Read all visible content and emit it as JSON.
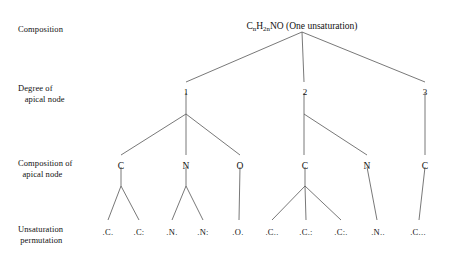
{
  "figure": {
    "type": "tree-diagram",
    "background": "#ffffff",
    "line_color": "#555555",
    "text_color": "#111111"
  },
  "row_labels": [
    {
      "id": "composition",
      "text": "Composition",
      "x": 18,
      "y": 24,
      "align": "left"
    },
    {
      "id": "degree-of-apical-node",
      "text": "Degree of\n   apical node",
      "x": 18,
      "y": 83,
      "align": "left"
    },
    {
      "id": "composition-of-apical-node",
      "text": "Composition of\n  apical node",
      "x": 18,
      "y": 158,
      "align": "left"
    },
    {
      "id": "unsaturation-permutation",
      "text": "Unsaturation\n permutation",
      "x": 18,
      "y": 224,
      "align": "left"
    }
  ],
  "root": {
    "id": "root",
    "label_prefix": "C",
    "sub1": "n",
    "label_mid": "H",
    "sub2": "2n",
    "label_suffix": "NO (One unsaturation)",
    "plain_text": "CnH2nNO (One unsaturation)",
    "x": 302,
    "y": 22
  },
  "degree_nodes": [
    {
      "id": "degree-1",
      "label": "1",
      "x": 186,
      "y": 88
    },
    {
      "id": "degree-2",
      "label": "2",
      "x": 305,
      "y": 88
    },
    {
      "id": "degree-3",
      "label": "3",
      "x": 425,
      "y": 88
    }
  ],
  "composition_nodes": [
    {
      "id": "comp-1-c",
      "label": "C",
      "x": 121,
      "y": 162,
      "parent": "degree-1"
    },
    {
      "id": "comp-1-n",
      "label": "N",
      "x": 186,
      "y": 162,
      "parent": "degree-1"
    },
    {
      "id": "comp-1-o",
      "label": "O",
      "x": 240,
      "y": 162,
      "parent": "degree-1"
    },
    {
      "id": "comp-2-c",
      "label": "C",
      "x": 305,
      "y": 162,
      "parent": "degree-2"
    },
    {
      "id": "comp-2-n",
      "label": "N",
      "x": 367,
      "y": 162,
      "parent": "degree-2"
    },
    {
      "id": "comp-3-c",
      "label": "C",
      "x": 425,
      "y": 162,
      "parent": "degree-3"
    }
  ],
  "permutation_nodes": [
    {
      "id": "perm-1",
      "label": ".C.",
      "x": 108,
      "y": 228,
      "parent": "comp-1-c"
    },
    {
      "id": "perm-2",
      "label": ".C:",
      "x": 139,
      "y": 228,
      "parent": "comp-1-c"
    },
    {
      "id": "perm-3",
      "label": ".N.",
      "x": 172,
      "y": 228,
      "parent": "comp-1-n"
    },
    {
      "id": "perm-4",
      "label": ".N:",
      "x": 203,
      "y": 228,
      "parent": "comp-1-n"
    },
    {
      "id": "perm-5",
      "label": ".O.",
      "x": 238,
      "y": 228,
      "parent": "comp-1-o"
    },
    {
      "id": "perm-6",
      "label": ".C..",
      "x": 272,
      "y": 228,
      "parent": "comp-2-c"
    },
    {
      "id": "perm-7",
      "label": ".C.:",
      "x": 306,
      "y": 228,
      "parent": "comp-2-c"
    },
    {
      "id": "perm-8",
      "label": ".C:.",
      "x": 341,
      "y": 228,
      "parent": "comp-2-c"
    },
    {
      "id": "perm-9",
      "label": ".N..",
      "x": 378,
      "y": 228,
      "parent": "comp-2-n"
    },
    {
      "id": "perm-10",
      "label": ".C...",
      "x": 418,
      "y": 228,
      "parent": "comp-3-c"
    }
  ],
  "edges": [
    {
      "id": "edge-root-1",
      "x1": 302,
      "y1": 32,
      "x2": 186,
      "y2": 82
    },
    {
      "id": "edge-root-2",
      "x1": 302,
      "y1": 32,
      "x2": 304,
      "y2": 82
    },
    {
      "id": "edge-root-3",
      "x1": 302,
      "y1": 32,
      "x2": 425,
      "y2": 82
    },
    {
      "id": "edge-1-stem",
      "x1": 186,
      "y1": 93,
      "x2": 186,
      "y2": 114
    },
    {
      "id": "edge-1-c",
      "x1": 186,
      "y1": 114,
      "x2": 121,
      "y2": 155
    },
    {
      "id": "edge-1-n",
      "x1": 186,
      "y1": 114,
      "x2": 186,
      "y2": 155
    },
    {
      "id": "edge-1-o",
      "x1": 186,
      "y1": 114,
      "x2": 240,
      "y2": 155
    },
    {
      "id": "edge-2-stem",
      "x1": 304,
      "y1": 93,
      "x2": 304,
      "y2": 114
    },
    {
      "id": "edge-2-c",
      "x1": 304,
      "y1": 114,
      "x2": 304,
      "y2": 155
    },
    {
      "id": "edge-2-n",
      "x1": 304,
      "y1": 114,
      "x2": 367,
      "y2": 155
    },
    {
      "id": "edge-3-c",
      "x1": 425,
      "y1": 93,
      "x2": 425,
      "y2": 155
    },
    {
      "id": "edge-c1-stem",
      "x1": 121,
      "y1": 167,
      "x2": 121,
      "y2": 186
    },
    {
      "id": "edge-c1-a",
      "x1": 121,
      "y1": 186,
      "x2": 108,
      "y2": 220
    },
    {
      "id": "edge-c1-b",
      "x1": 121,
      "y1": 186,
      "x2": 139,
      "y2": 220
    },
    {
      "id": "edge-n1-stem",
      "x1": 186,
      "y1": 167,
      "x2": 186,
      "y2": 186
    },
    {
      "id": "edge-n1-a",
      "x1": 186,
      "y1": 186,
      "x2": 172,
      "y2": 220
    },
    {
      "id": "edge-n1-b",
      "x1": 186,
      "y1": 186,
      "x2": 203,
      "y2": 220
    },
    {
      "id": "edge-o1",
      "x1": 240,
      "y1": 167,
      "x2": 239,
      "y2": 220
    },
    {
      "id": "edge-c2-stem",
      "x1": 305,
      "y1": 167,
      "x2": 305,
      "y2": 186
    },
    {
      "id": "edge-c2-a",
      "x1": 305,
      "y1": 186,
      "x2": 272,
      "y2": 220
    },
    {
      "id": "edge-c2-b",
      "x1": 305,
      "y1": 186,
      "x2": 306,
      "y2": 220
    },
    {
      "id": "edge-c2-c",
      "x1": 305,
      "y1": 186,
      "x2": 341,
      "y2": 220
    },
    {
      "id": "edge-n2",
      "x1": 367,
      "y1": 167,
      "x2": 377,
      "y2": 220
    },
    {
      "id": "edge-c3",
      "x1": 425,
      "y1": 167,
      "x2": 419,
      "y2": 220
    }
  ]
}
